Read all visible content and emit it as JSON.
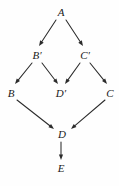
{
  "diagram": {
    "background_color": "#fefefe",
    "stroke_color": "#2b2b2b",
    "label_color": "#1a1a1a",
    "width": 119,
    "height": 186,
    "nodes": [
      {
        "id": "A",
        "label": "A",
        "x": 61,
        "y": 12
      },
      {
        "id": "Bp",
        "label": "B′",
        "x": 37,
        "y": 55
      },
      {
        "id": "Cp",
        "label": "C′",
        "x": 85,
        "y": 55
      },
      {
        "id": "B",
        "label": "B",
        "x": 11,
        "y": 93
      },
      {
        "id": "Dp",
        "label": "D′",
        "x": 61,
        "y": 93
      },
      {
        "id": "C",
        "label": "C",
        "x": 110,
        "y": 93
      },
      {
        "id": "D",
        "label": "D",
        "x": 62,
        "y": 134
      },
      {
        "id": "E",
        "label": "E",
        "x": 61,
        "y": 168
      }
    ],
    "edges": [
      {
        "id": "A-Bp",
        "from": "A",
        "to": "Bp",
        "x1": 56,
        "y1": 20,
        "x2": 39,
        "y2": 46
      },
      {
        "id": "A-Cp",
        "from": "A",
        "to": "Cp",
        "x1": 66,
        "y1": 20,
        "x2": 83,
        "y2": 46
      },
      {
        "id": "Bp-B",
        "from": "Bp",
        "to": "B",
        "x1": 32,
        "y1": 63,
        "x2": 15,
        "y2": 84
      },
      {
        "id": "Bp-Dp",
        "from": "Bp",
        "to": "Dp",
        "x1": 42,
        "y1": 63,
        "x2": 58,
        "y2": 84
      },
      {
        "id": "Cp-Dp",
        "from": "Cp",
        "to": "Dp",
        "x1": 80,
        "y1": 63,
        "x2": 65,
        "y2": 84
      },
      {
        "id": "Cp-C",
        "from": "Cp",
        "to": "C",
        "x1": 90,
        "y1": 63,
        "x2": 107,
        "y2": 84
      },
      {
        "id": "B-D",
        "from": "B",
        "to": "D",
        "x1": 17,
        "y1": 100,
        "x2": 54,
        "y2": 129
      },
      {
        "id": "C-D",
        "from": "C",
        "to": "D",
        "x1": 105,
        "y1": 100,
        "x2": 71,
        "y2": 129
      },
      {
        "id": "D-E",
        "from": "D",
        "to": "E",
        "x1": 61,
        "y1": 142,
        "x2": 61,
        "y2": 160
      }
    ]
  }
}
